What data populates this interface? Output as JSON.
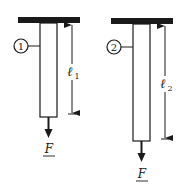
{
  "diagram": {
    "type": "two hanging bars under axial load",
    "colors": {
      "stroke": "#1a1a1a",
      "background": "#ffffff"
    },
    "bars": [
      {
        "id": "bar-1",
        "number_label": "1",
        "length_label": "ℓ",
        "length_subscript": "1",
        "force_label": "F"
      },
      {
        "id": "bar-2",
        "number_label": "2",
        "length_label": "ℓ",
        "length_subscript": "2",
        "force_label": "F"
      }
    ]
  }
}
